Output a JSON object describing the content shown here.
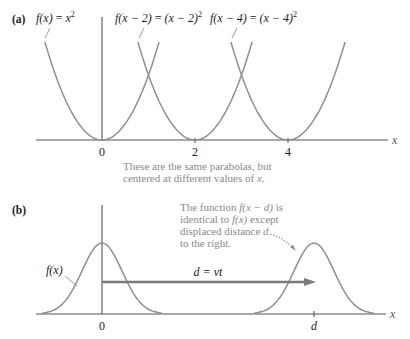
{
  "panel_a": {
    "label": "(a)",
    "curve_labels": [
      {
        "fn": "f",
        "arg": "(x)",
        "eq": " = ",
        "rhs": "x",
        "sup": "2"
      },
      {
        "fn": "f",
        "arg": "(x − 2)",
        "eq": " = ",
        "rhs": "(x − 2)",
        "sup": "2"
      },
      {
        "fn": "f",
        "arg": "(x − 4)",
        "eq": " = ",
        "rhs": "(x − 4)",
        "sup": "2"
      }
    ],
    "ticks": [
      "0",
      "2",
      "4"
    ],
    "axis_label": "x",
    "caption": {
      "line1": "These are the same parabolas, but",
      "line2_pre": "centered at different values of ",
      "line2_var": "x",
      "line2_post": "."
    }
  },
  "panel_b": {
    "label": "(b)",
    "curve_label": "f(x)",
    "ticks": [
      "0",
      "d"
    ],
    "axis_label": "x",
    "arrow_label": "d = vt",
    "note": {
      "line1_pre": "The function ",
      "line1_var": "f(x − d)",
      "line1_post": " is",
      "line2_pre": "identical to ",
      "line2_var": "f(x)",
      "line2_post": "  except",
      "line3_pre": "displaced distance ",
      "line3_var": "d",
      "line4": "to the right."
    }
  },
  "chart_data": [
    {
      "type": "line",
      "title": "(a)",
      "xlabel": "x",
      "ylabel": "",
      "x_ticks": [
        0,
        2,
        4
      ],
      "series": [
        {
          "name": "f(x) = x^2",
          "center": 0
        },
        {
          "name": "f(x - 2) = (x - 2)^2",
          "center": 2
        },
        {
          "name": "f(x - 4) = (x - 4)^2",
          "center": 4
        }
      ],
      "annotation": "These are the same parabolas, but centered at different values of x.",
      "xlim": [
        -1.4,
        6.2
      ],
      "grid": false
    },
    {
      "type": "line",
      "title": "(b)",
      "xlabel": "x",
      "x_ticks": [
        "0",
        "d"
      ],
      "series": [
        {
          "name": "f(x)",
          "shape": "pulse",
          "center": "0"
        },
        {
          "name": "f(x - d)",
          "shape": "pulse",
          "center": "d"
        }
      ],
      "annotations": [
        "d = vt",
        "The function f(x − d) is identical to f(x) except displaced distance d to the right."
      ],
      "grid": false
    }
  ],
  "render": {
    "colors": {
      "curve": "#8f8f8f",
      "axis": "#555555",
      "caption": "#8a8a8a",
      "arrow": "#7a7a7a"
    },
    "panel_a": {
      "origin_x": 102,
      "axis_y": 140,
      "px_per_unit": 46.5,
      "y_scale": 65,
      "top_y": 42,
      "centers": [
        0,
        2,
        4
      ]
    },
    "panel_b": {
      "axis_y": 314,
      "peak_height": 71,
      "sigma": 20,
      "centers_px": [
        102,
        314
      ]
    }
  }
}
